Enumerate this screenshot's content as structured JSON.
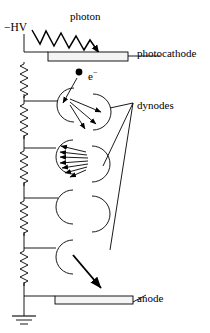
{
  "figure": {
    "name": "photomultiplier-tube-schematic",
    "title_visible": false,
    "background_color": "#ffffff",
    "stroke_color": "#000000",
    "plate_fill_color": "#f2f2f2",
    "width": 210,
    "height": 333
  },
  "labels": {
    "photon": "photon",
    "high_voltage": "−HV",
    "photocathode": "photocathode",
    "electron": "e",
    "electron_charge": "−",
    "dynodes": "dynodes",
    "anode": "anode"
  },
  "components": {
    "photocathode": {
      "label": "photocathode",
      "shape": "rectangle-plate",
      "x": 48,
      "y": 52,
      "width": 80,
      "height": 9
    },
    "anode": {
      "label": "anode",
      "shape": "rectangle-plate",
      "x": 55,
      "y": 296,
      "width": 78,
      "height": 8
    },
    "dynodes": {
      "label": "dynodes",
      "count": 7,
      "shape": "c-shaped-arc",
      "sides": [
        "left",
        "right",
        "left",
        "right",
        "left",
        "right",
        "left"
      ]
    },
    "voltage_divider": {
      "label": "−HV",
      "resistor_count": 8,
      "shape": "zigzag-resistor-chain",
      "ground": true
    },
    "photon_ray": {
      "label": "photon",
      "shape": "zigzag-wave-arrow",
      "direction": "down-right"
    },
    "electron_cascade": {
      "label": "e−",
      "stages": [
        1,
        1,
        3,
        7,
        1
      ],
      "shape": "arrow"
    }
  }
}
